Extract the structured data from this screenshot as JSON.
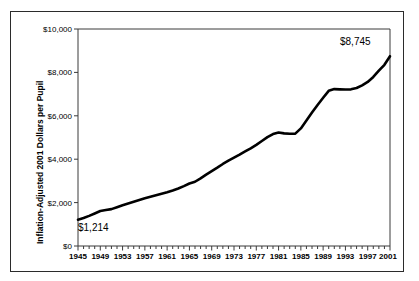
{
  "figure": {
    "background_color": "#ffffff",
    "border_color": "#2b2b2b",
    "line_color": "#000000"
  },
  "axis": {
    "y_title": "Inflation-Adjusted 2001 Dollars per Pupil",
    "y_ticks": [
      "$0",
      "$2,000",
      "$4,000",
      "$6,000",
      "$8,000",
      "$10,000"
    ],
    "x_ticks": [
      "1945",
      "1949",
      "1953",
      "1957",
      "1961",
      "1965",
      "1969",
      "1973",
      "1977",
      "1981",
      "1985",
      "1989",
      "1993",
      "1997",
      "2001"
    ]
  },
  "annotations": {
    "start_label": "$1,214",
    "end_label": "$8,745"
  },
  "chart_data": {
    "type": "line",
    "title": "",
    "subtitle": "",
    "xlabel": "",
    "ylabel": "Inflation-Adjusted 2001 Dollars per Pupil",
    "xlim": [
      1945,
      2001
    ],
    "ylim": [
      0,
      10000
    ],
    "ytick_values": [
      0,
      2000,
      4000,
      6000,
      8000,
      10000
    ],
    "xtick_values": [
      1945,
      1949,
      1953,
      1957,
      1961,
      1965,
      1969,
      1973,
      1977,
      1981,
      1985,
      1989,
      1993,
      1997,
      2001
    ],
    "x_minor_tick_interval": 1,
    "grid": false,
    "legend": "none",
    "data_labels": [
      {
        "x": 1945,
        "y": 1214,
        "text": "$1,214"
      },
      {
        "x": 2001,
        "y": 8745,
        "text": "$8,745"
      }
    ],
    "series": [
      {
        "name": "Per-pupil spending",
        "color": "#000000",
        "x": [
          1945,
          1946,
          1947,
          1948,
          1949,
          1950,
          1951,
          1952,
          1953,
          1954,
          1955,
          1956,
          1957,
          1958,
          1959,
          1960,
          1961,
          1962,
          1963,
          1964,
          1965,
          1966,
          1967,
          1968,
          1969,
          1970,
          1971,
          1972,
          1973,
          1974,
          1975,
          1976,
          1977,
          1978,
          1979,
          1980,
          1981,
          1982,
          1983,
          1984,
          1985,
          1986,
          1987,
          1988,
          1989,
          1990,
          1991,
          1992,
          1993,
          1994,
          1995,
          1996,
          1997,
          1998,
          1999,
          2000,
          2001
        ],
        "values": [
          1214,
          1290,
          1390,
          1500,
          1610,
          1655,
          1700,
          1790,
          1880,
          1960,
          2040,
          2120,
          2200,
          2270,
          2340,
          2410,
          2480,
          2560,
          2650,
          2760,
          2880,
          2960,
          3120,
          3290,
          3450,
          3610,
          3780,
          3930,
          4070,
          4210,
          4360,
          4500,
          4660,
          4840,
          5020,
          5160,
          5230,
          5190,
          5170,
          5180,
          5420,
          5780,
          6150,
          6500,
          6830,
          7150,
          7230,
          7220,
          7210,
          7220,
          7280,
          7400,
          7560,
          7790,
          8080,
          8350,
          8745
        ]
      }
    ]
  }
}
